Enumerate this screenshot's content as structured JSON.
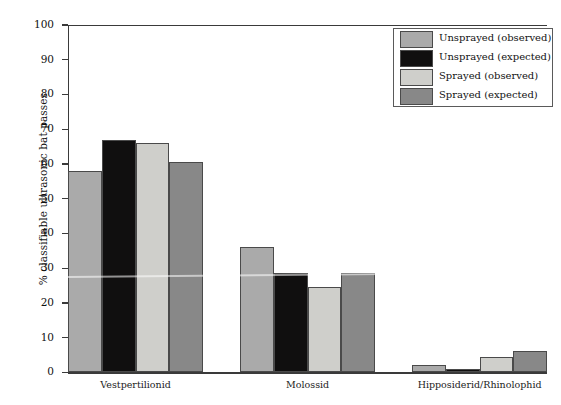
{
  "chart_data": {
    "type": "bar",
    "title": "",
    "xlabel": "",
    "ylabel": "% classifiable ultrasonic bat passes",
    "ylim": [
      0,
      100
    ],
    "yticks": [
      0,
      10,
      20,
      30,
      40,
      50,
      60,
      70,
      80,
      90,
      100
    ],
    "grid": false,
    "legend_position": "top-right",
    "categories": [
      "Vestpertilionid",
      "Molossid",
      "Hipposiderid/Rhinolophid"
    ],
    "series": [
      {
        "name": "Unsprayed (observed)",
        "color": "#aaaaaa",
        "values": [
          58,
          36,
          2.2
        ]
      },
      {
        "name": "Unsprayed (expected)",
        "color": "#100f0f",
        "values": [
          67,
          28.5,
          1.0
        ]
      },
      {
        "name": "Sprayed (observed)",
        "color": "#cfcfcb",
        "values": [
          66,
          24.5,
          4.4
        ]
      },
      {
        "name": "Sprayed (expected)",
        "color": "#888888",
        "values": [
          60.5,
          28.5,
          6.3
        ]
      }
    ]
  },
  "legend": {
    "items": [
      {
        "label": "Unsprayed (observed)"
      },
      {
        "label": "Unsprayed (expected)"
      },
      {
        "label": "Sprayed (observed)"
      },
      {
        "label": "Sprayed (expected)"
      }
    ]
  }
}
